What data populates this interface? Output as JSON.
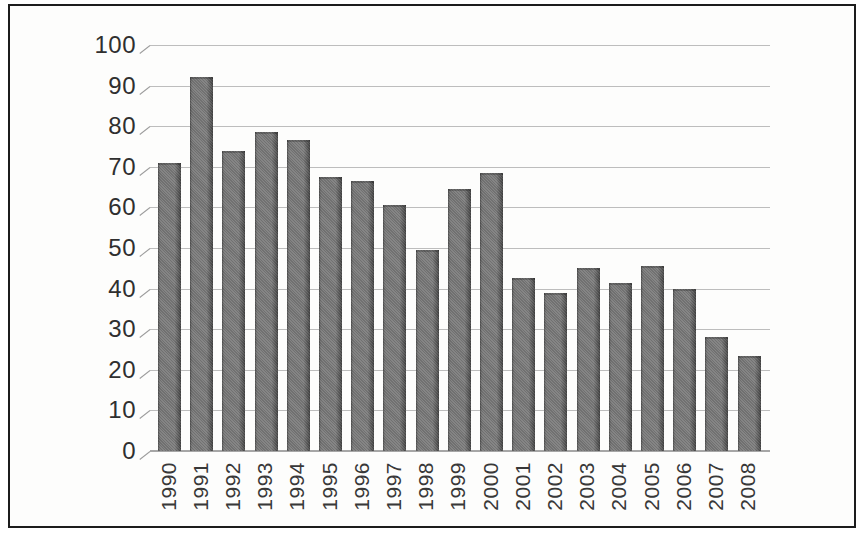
{
  "figure": {
    "kind": "scanned-book-bar-chart",
    "frame_border_color": "#1c1c1c",
    "background_color": "#fdfdfc",
    "bar_color": "#7b7b7b",
    "bar_edge_color": "#454545",
    "gridline_color": "#bdbdbd",
    "axis_text_color": "#2f2f2f"
  },
  "chart_data": {
    "type": "bar",
    "title": "",
    "xlabel": "",
    "ylabel": "",
    "categories": [
      "1990",
      "1991",
      "1992",
      "1993",
      "1994",
      "1995",
      "1996",
      "1997",
      "1998",
      "1999",
      "2000",
      "2001",
      "2002",
      "2003",
      "2004",
      "2005",
      "2006",
      "2007",
      "2008"
    ],
    "values": [
      71,
      92,
      74,
      78.5,
      76.5,
      67.5,
      66.5,
      60.5,
      49.5,
      64.5,
      68.5,
      42.5,
      39,
      45,
      41.5,
      45.5,
      40,
      28,
      23.5
    ],
    "ylim": [
      0,
      100
    ],
    "yticks": [
      0,
      10,
      20,
      30,
      40,
      50,
      60,
      70,
      80,
      90,
      100
    ],
    "grid": true,
    "legend": "none"
  }
}
